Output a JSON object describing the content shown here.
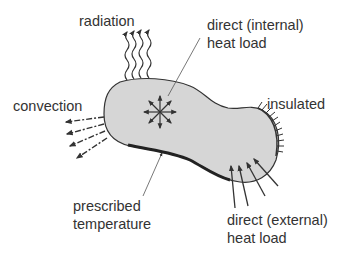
{
  "labels": {
    "radiation": "radiation",
    "internal_line1": "direct (internal)",
    "internal_line2": "heat load",
    "convection": "convection",
    "insulated": "insulated",
    "prescribed_line1": "prescribed",
    "prescribed_line2": "temperature",
    "external_line1": "direct (external)",
    "external_line2": "heat load"
  },
  "colors": {
    "body_fill": "#d6d6d6",
    "stroke": "#333333",
    "text": "#333333"
  }
}
